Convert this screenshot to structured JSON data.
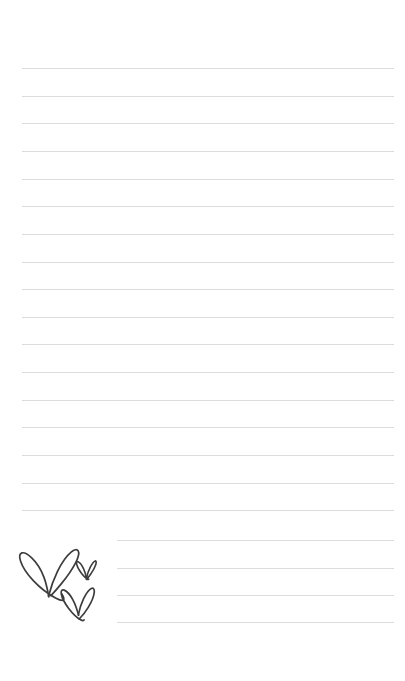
{
  "page": {
    "width": 405,
    "height": 681,
    "background_color": "#ffffff"
  },
  "ruling": {
    "line_color": "#dcdcdc",
    "line_thickness_px": 1,
    "line_spacing_px": 27.6,
    "full_left_x": 22,
    "indented_left_x": 117,
    "right_x": 394,
    "first_line_y": 68,
    "line_count": 21,
    "indent_start_index": 17,
    "lines": [
      {
        "index": 0,
        "y": 68,
        "x1": 22,
        "x2": 394,
        "indented": false
      },
      {
        "index": 1,
        "y": 96,
        "x1": 22,
        "x2": 394,
        "indented": false
      },
      {
        "index": 2,
        "y": 123,
        "x1": 22,
        "x2": 394,
        "indented": false
      },
      {
        "index": 3,
        "y": 151,
        "x1": 22,
        "x2": 394,
        "indented": false
      },
      {
        "index": 4,
        "y": 179,
        "x1": 22,
        "x2": 394,
        "indented": false
      },
      {
        "index": 5,
        "y": 206,
        "x1": 22,
        "x2": 394,
        "indented": false
      },
      {
        "index": 6,
        "y": 234,
        "x1": 22,
        "x2": 394,
        "indented": false
      },
      {
        "index": 7,
        "y": 262,
        "x1": 22,
        "x2": 394,
        "indented": false
      },
      {
        "index": 8,
        "y": 289,
        "x1": 22,
        "x2": 394,
        "indented": false
      },
      {
        "index": 9,
        "y": 317,
        "x1": 22,
        "x2": 394,
        "indented": false
      },
      {
        "index": 10,
        "y": 344,
        "x1": 22,
        "x2": 394,
        "indented": false
      },
      {
        "index": 11,
        "y": 372,
        "x1": 22,
        "x2": 394,
        "indented": false
      },
      {
        "index": 12,
        "y": 400,
        "x1": 22,
        "x2": 394,
        "indented": false
      },
      {
        "index": 13,
        "y": 427,
        "x1": 22,
        "x2": 394,
        "indented": false
      },
      {
        "index": 14,
        "y": 455,
        "x1": 22,
        "x2": 394,
        "indented": false
      },
      {
        "index": 15,
        "y": 483,
        "x1": 22,
        "x2": 394,
        "indented": false
      },
      {
        "index": 16,
        "y": 510,
        "x1": 22,
        "x2": 394,
        "indented": false
      },
      {
        "index": 17,
        "y": 540,
        "x1": 117,
        "x2": 394,
        "indented": true
      },
      {
        "index": 18,
        "y": 568,
        "x1": 117,
        "x2": 394,
        "indented": true
      },
      {
        "index": 19,
        "y": 595,
        "x1": 117,
        "x2": 394,
        "indented": true
      },
      {
        "index": 20,
        "y": 622,
        "x1": 117,
        "x2": 394,
        "indented": true
      }
    ]
  },
  "doodle": {
    "name": "three-hand-drawn-hearts",
    "stroke_color": "#3d3d3d",
    "fill": "none",
    "region": {
      "x": 14,
      "y": 538,
      "width": 92,
      "height": 86
    },
    "hearts": [
      {
        "name": "large-heart",
        "size": "large",
        "x": 20,
        "y": 546,
        "width": 58,
        "height": 52
      },
      {
        "name": "small-heart",
        "size": "small",
        "x": 77,
        "y": 560,
        "width": 19,
        "height": 20
      },
      {
        "name": "medium-heart",
        "size": "medium",
        "x": 61,
        "y": 584,
        "width": 35,
        "height": 33
      }
    ]
  }
}
